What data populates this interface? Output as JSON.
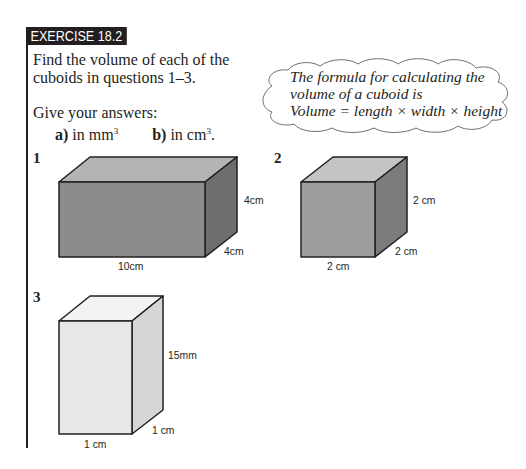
{
  "header": {
    "title": "EXERCISE 18.2"
  },
  "intro": {
    "line1": "Find the volume of each of the",
    "line2": "cuboids in questions 1–3.",
    "give": "Give your answers:",
    "part_a_label": "a)",
    "part_a_text": "in mm",
    "part_a_sup": "3",
    "part_b_label": "b)",
    "part_b_text": "in cm",
    "part_b_sup": "3",
    "part_b_end": "."
  },
  "hint_cloud": {
    "line1": "The formula for calculating the",
    "line2": "volume of a cuboid is",
    "line3": "Volume = length × width × height"
  },
  "questions": [
    {
      "number": "1",
      "length": "10cm",
      "width": "4cm",
      "height": "4cm",
      "color": "#8a8a8a"
    },
    {
      "number": "2",
      "length": "2 cm",
      "width": "2 cm",
      "height": "2 cm",
      "color": "#9a9a9a"
    },
    {
      "number": "3",
      "length": "1 cm",
      "width": "1 cm",
      "height": "15mm",
      "color": "#e6e6e6"
    }
  ]
}
